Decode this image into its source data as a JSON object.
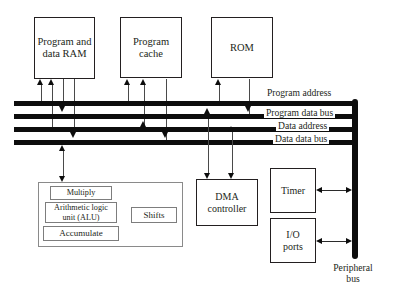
{
  "diagram": {
    "width": 396,
    "height": 291,
    "colors": {
      "bus": "#0d0d0d",
      "box_border": "#231f20",
      "inner_border": "#7d7d7d",
      "background": "#ffffff",
      "text": "#231f20"
    },
    "memory_blocks": [
      {
        "id": "program-and-data-ram",
        "label": "Program and\ndata RAM",
        "x": 34,
        "y": 17,
        "w": 61,
        "h": 62
      },
      {
        "id": "program-cache",
        "label": "Program\ncache",
        "x": 120,
        "y": 17,
        "w": 62,
        "h": 61
      },
      {
        "id": "rom",
        "label": "ROM",
        "x": 211,
        "y": 17,
        "w": 62,
        "h": 61
      }
    ],
    "buses": [
      {
        "id": "program-address",
        "label": "Program address",
        "y": 101,
        "thickness": 5,
        "x1": 14,
        "x2": 357,
        "label_x": 265,
        "label_y": 88
      },
      {
        "id": "program-data-bus",
        "label": "Program data bus",
        "y": 114,
        "thickness": 5,
        "x1": 14,
        "x2": 357,
        "label_x": 264,
        "label_y": 108
      },
      {
        "id": "data-address",
        "label": "Data address",
        "y": 127,
        "thickness": 5,
        "x1": 14,
        "x2": 357,
        "label_x": 276,
        "label_y": 121
      },
      {
        "id": "data-data-bus",
        "label": "Data data bus",
        "y": 140,
        "thickness": 5,
        "x1": 14,
        "x2": 357,
        "label_x": 273,
        "label_y": 134
      }
    ],
    "peripheral_bus": {
      "id": "peripheral-bus",
      "label": "Peripheral\nbus",
      "x": 352,
      "y1": 99,
      "y2": 259,
      "thickness": 6,
      "label_x": 330,
      "label_y": 262
    },
    "alu_group": {
      "id": "alu-group",
      "x": 38,
      "y": 182,
      "w": 145,
      "h": 65,
      "children": [
        {
          "id": "multiply",
          "label": "Multiply",
          "x": 50,
          "y": 186,
          "w": 62,
          "h": 14
        },
        {
          "id": "arithmetic-logic-unit",
          "label": "Arithmetic logic\nunit (ALU)",
          "x": 45,
          "y": 202,
          "w": 72,
          "h": 21
        },
        {
          "id": "accumulate",
          "label": "Accumulate",
          "x": 43,
          "y": 226,
          "w": 76,
          "h": 15
        },
        {
          "id": "shifts",
          "label": "Shifts",
          "x": 131,
          "y": 207,
          "w": 46,
          "h": 16
        }
      ]
    },
    "peripheral_blocks": [
      {
        "id": "dma-controller",
        "label": "DMA\ncontroller",
        "x": 196,
        "y": 179,
        "w": 62,
        "h": 47
      },
      {
        "id": "timer",
        "label": "Timer",
        "x": 270,
        "y": 168,
        "w": 46,
        "h": 45
      },
      {
        "id": "io-ports",
        "label": "I/O\nports",
        "x": 270,
        "y": 218,
        "w": 46,
        "h": 45
      }
    ]
  }
}
